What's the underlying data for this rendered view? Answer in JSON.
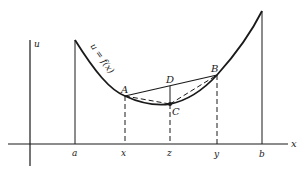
{
  "figure": {
    "type": "convex-function-diagram",
    "axes": {
      "horizontal_label": "x",
      "vertical_label": "u"
    },
    "curve_label": "u = f(x)",
    "x_ticks": [
      {
        "id": "a",
        "label": "a"
      },
      {
        "id": "x",
        "label": "x"
      },
      {
        "id": "z",
        "label": "z"
      },
      {
        "id": "y",
        "label": "y"
      },
      {
        "id": "b",
        "label": "b"
      }
    ],
    "points": [
      {
        "id": "A",
        "label": "A"
      },
      {
        "id": "B",
        "label": "B"
      },
      {
        "id": "C",
        "label": "C"
      },
      {
        "id": "D",
        "label": "D"
      }
    ],
    "colors": {
      "ink": "#1a1a1a",
      "background": "#ffffff"
    }
  }
}
